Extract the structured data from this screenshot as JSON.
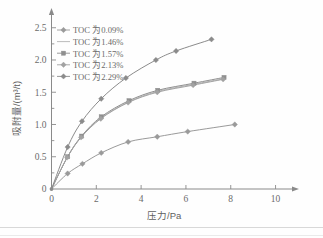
{
  "figure": {
    "background": "#fefefe",
    "axis_color": "#8a8a8a",
    "text_color": "#6a6a6a"
  },
  "chart_data": {
    "type": "line",
    "title": "",
    "subtitle": "",
    "xlabel": "压力/Pa",
    "ylabel": "吸附量/(m³/t)",
    "xlim": [
      0,
      10.6
    ],
    "ylim": [
      0,
      2.62
    ],
    "xticks": [
      0,
      2,
      4,
      6,
      8,
      10
    ],
    "xtick_labels": [
      "0",
      "2",
      "4",
      "6",
      "8",
      "10"
    ],
    "yticks": [
      0,
      0.5,
      1.0,
      1.5,
      2.0,
      2.5
    ],
    "ytick_labels": [
      "0",
      "0.5",
      "1.0",
      "1.5",
      "2.0",
      "2.5"
    ],
    "grid": false,
    "legend_position": "upper left",
    "axis_arrows": true,
    "series": [
      {
        "name": "TOC 为0.09%",
        "color": "#9a9a9a",
        "marker": "diamond",
        "x": [
          0,
          0.72,
          1.38,
          2.22,
          3.42,
          4.72,
          6.08,
          8.18
        ],
        "y": [
          0,
          0.24,
          0.39,
          0.56,
          0.73,
          0.81,
          0.89,
          1.0
        ]
      },
      {
        "name": "TOC 为1.46%",
        "color": "#b4b4b4",
        "marker": "none",
        "x": [
          0,
          0.72,
          1.34,
          2.2,
          3.44,
          4.7,
          6.3,
          7.68
        ],
        "y": [
          0,
          0.5,
          0.81,
          1.1,
          1.35,
          1.51,
          1.62,
          1.71
        ]
      },
      {
        "name": "TOC 为1.57%",
        "color": "#8f8f8f",
        "marker": "square",
        "x": [
          0,
          0.72,
          1.34,
          2.22,
          3.46,
          4.74,
          6.36,
          7.7
        ],
        "y": [
          0,
          0.5,
          0.82,
          1.12,
          1.37,
          1.53,
          1.64,
          1.73
        ]
      },
      {
        "name": "TOC 为2.13%",
        "color": "#a2a2a2",
        "marker": "diamond",
        "x": [
          0,
          0.7,
          1.32,
          2.2,
          3.42,
          4.72,
          6.32,
          7.66
        ],
        "y": [
          0,
          0.49,
          0.8,
          1.09,
          1.34,
          1.5,
          1.61,
          1.7
        ]
      },
      {
        "name": "TOC 为2.29%",
        "color": "#8b8b8b",
        "marker": "diamond",
        "x": [
          0,
          0.72,
          1.36,
          2.22,
          3.32,
          4.66,
          5.56,
          7.14
        ],
        "y": [
          0,
          0.65,
          1.05,
          1.4,
          1.72,
          2.0,
          2.14,
          2.32
        ]
      }
    ]
  },
  "legend": {
    "entries": [
      {
        "label": "TOC 为0.09%"
      },
      {
        "label": "TOC 为1.46%"
      },
      {
        "label": "TOC 为1.57%"
      },
      {
        "label": "TOC 为2.13%"
      },
      {
        "label": "TOC 为2.29%"
      }
    ]
  }
}
